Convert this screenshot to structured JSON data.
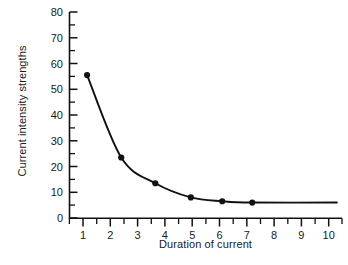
{
  "chart_data": {
    "type": "line",
    "title": "",
    "xlabel": "Duration of current",
    "ylabel": "Current intensity strengths",
    "xlim": [
      0.3,
      10.4
    ],
    "ylim": [
      0,
      80
    ],
    "grid": false,
    "legend": null,
    "x_ticks": [
      "1",
      "2",
      "3",
      "4",
      "5",
      "6",
      "7",
      "8",
      "9",
      "10"
    ],
    "x_tick_values": [
      1,
      2,
      3,
      4,
      5,
      6,
      7,
      8,
      9,
      10
    ],
    "x_minor_tick_values": [
      0.5,
      1.5,
      2.5,
      3.5,
      4.5,
      5.5,
      6.5,
      7.5,
      8.5,
      9.5
    ],
    "y_ticks": [
      "0",
      "10",
      "20",
      "30",
      "40",
      "50",
      "60",
      "70",
      "80"
    ],
    "y_tick_values": [
      0,
      10,
      20,
      30,
      40,
      50,
      60,
      70,
      80
    ],
    "y_minor_tick_values": [
      5,
      15,
      25,
      35,
      45,
      55,
      65,
      75
    ],
    "series": [
      {
        "name": "Current intensity vs duration",
        "marker": "filled-circle",
        "color": "#111111",
        "x": [
          1.15,
          2.4,
          3.65,
          4.95,
          6.1,
          7.2
        ],
        "values": [
          55.5,
          23.5,
          13.5,
          8.0,
          6.5,
          6.0
        ]
      }
    ],
    "curve_note": "smooth decaying curve through points, flattening to about 6 and extending to x = 10.3",
    "curve_tail_x": 10.3,
    "curve_tail_y": 6.0
  },
  "figure": {
    "caption_partial": "",
    "axis_color": "#111111",
    "background": "#ffffff"
  }
}
